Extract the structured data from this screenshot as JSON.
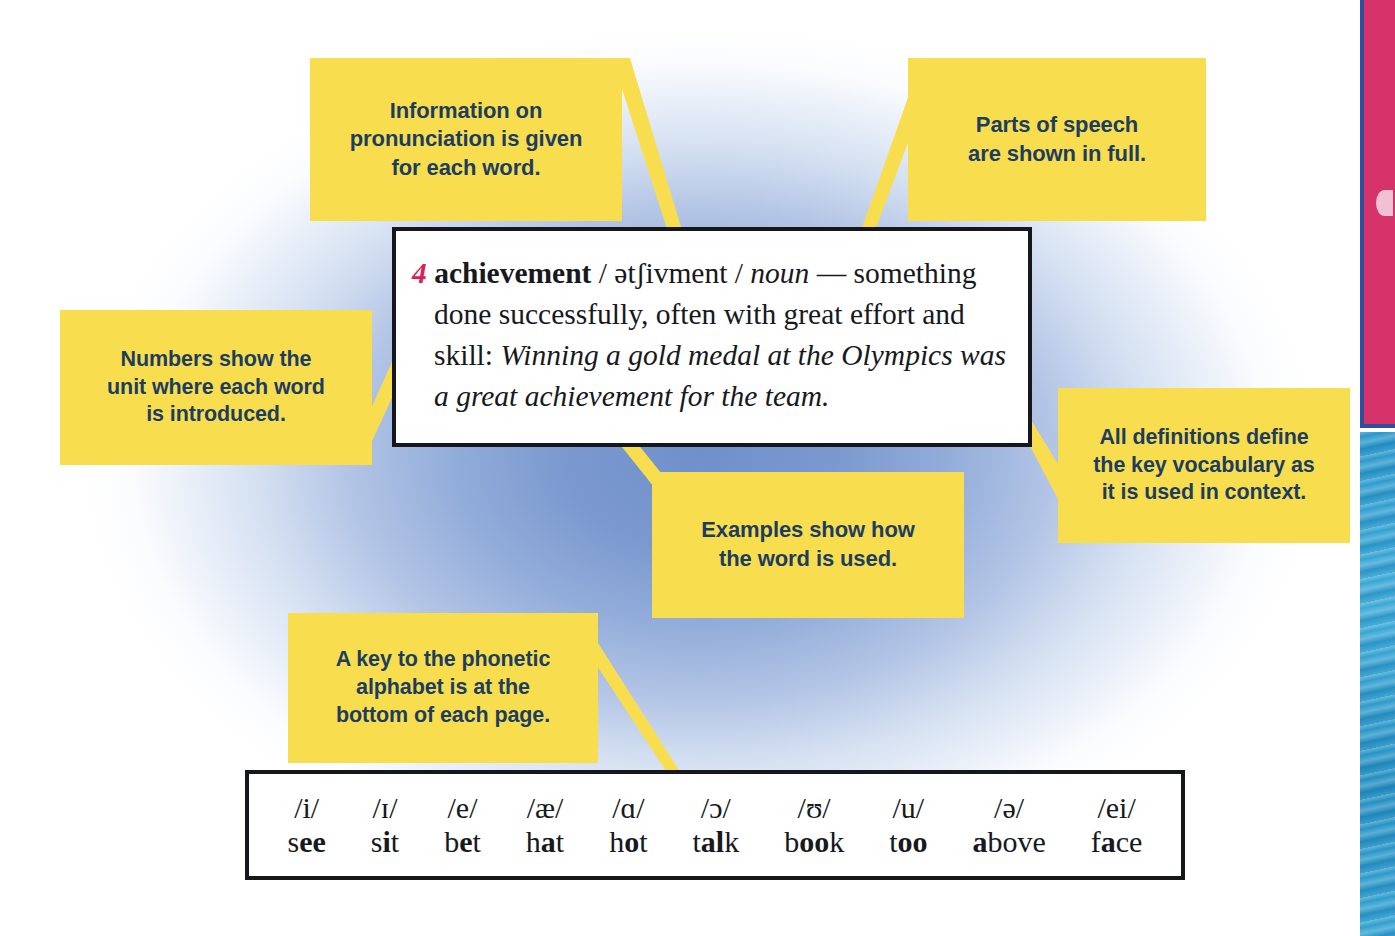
{
  "page": {
    "background_accent": "#6f90cb",
    "callout_fill": "#f8de4f",
    "callout_text_color": "#1d3d60",
    "edge_pink": "#d6326a",
    "edge_blue": "#2595c9"
  },
  "callouts": [
    {
      "id": "pronunciation",
      "lines": [
        "Information on",
        "pronunciation is given",
        "for each word."
      ]
    },
    {
      "id": "parts-of-speech",
      "lines": [
        "Parts of speech",
        "are shown in full."
      ]
    },
    {
      "id": "unit-numbers",
      "lines": [
        "Numbers show the",
        "unit where each word",
        "is introduced."
      ]
    },
    {
      "id": "definitions-context",
      "lines": [
        "All definitions define",
        "the key vocabulary as",
        "it is used in context."
      ]
    },
    {
      "id": "examples",
      "lines": [
        "Examples show how",
        "the word is used."
      ]
    },
    {
      "id": "phonetic-key",
      "lines": [
        "A key to the phonetic",
        "alphabet is at the",
        "bottom of each page."
      ]
    }
  ],
  "entry": {
    "unit_number": "4",
    "headword": "achievement",
    "pronunciation": "/ ətʃivment /",
    "part_of_speech": "noun",
    "dash": "—",
    "definition": "something done successfully, often with great effort and skill:",
    "example": "Winning a gold medal at the Olympics was a great achievement for the team."
  },
  "phonetic_key": [
    {
      "symbol": "/i/",
      "word_pre": "s",
      "word_bold": "ee",
      "word_post": ""
    },
    {
      "symbol": "/ɪ/",
      "word_pre": "s",
      "word_bold": "i",
      "word_post": "t"
    },
    {
      "symbol": "/e/",
      "word_pre": "b",
      "word_bold": "e",
      "word_post": "t"
    },
    {
      "symbol": "/æ/",
      "word_pre": "h",
      "word_bold": "a",
      "word_post": "t"
    },
    {
      "symbol": "/ɑ/",
      "word_pre": "h",
      "word_bold": "o",
      "word_post": "t"
    },
    {
      "symbol": "/ɔ/",
      "word_pre": "t",
      "word_bold": "al",
      "word_post": "k"
    },
    {
      "symbol": "/ʊ/",
      "word_pre": "b",
      "word_bold": "oo",
      "word_post": "k"
    },
    {
      "symbol": "/u/",
      "word_pre": "t",
      "word_bold": "oo",
      "word_post": ""
    },
    {
      "symbol": "/ə/",
      "word_pre": "",
      "word_bold": "a",
      "word_post": "bove"
    },
    {
      "symbol": "/ei/",
      "word_pre": "f",
      "word_bold": "a",
      "word_post": "ce"
    }
  ]
}
